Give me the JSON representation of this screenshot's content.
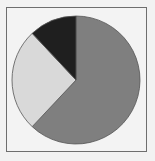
{
  "chart_data": {
    "type": "pie",
    "title": "",
    "categories": [
      "Medium gray",
      "Light gray",
      "Dark"
    ],
    "values": [
      62,
      26,
      12
    ],
    "colors": [
      "#7f7f7f",
      "#d9d9d9",
      "#1f1f1f"
    ],
    "start_angle_deg": 0,
    "direction": "clockwise",
    "legend": "none",
    "outline_color": "#555555"
  },
  "frame": {
    "border_color": "#6e6e6e",
    "background": "#f3f3f3"
  }
}
